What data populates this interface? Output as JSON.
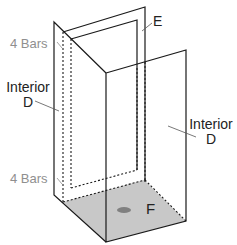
{
  "diagram": {
    "title_partial": "",
    "labels": {
      "bars_top": "4 Bars",
      "bars_bottom": "4 Bars",
      "interior_left_line1": "Interior",
      "interior_left_line2": "D",
      "interior_right_line1": "Interior",
      "interior_right_line2": "D",
      "back_panel": "E",
      "floor": "F"
    },
    "colors": {
      "line": "#1a1a1a",
      "floor_fill": "#c8c8c8",
      "floor_spot": "#808080",
      "bars_label": "#8f8f8f",
      "label": "#222222"
    }
  }
}
